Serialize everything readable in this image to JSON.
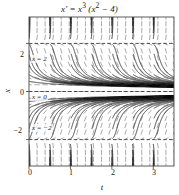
{
  "figure": {
    "title": "x' = x",
    "title_exp1": "3",
    "title_tail": " (x",
    "title_exp2": "2",
    "title_end": " − 4)",
    "title_plain": "x' = x3 (x2 - 4)",
    "xlabel": "t",
    "ylabel": "x"
  },
  "annotations": {
    "eq_top": "x = 2",
    "eq_mid": "x = 0",
    "eq_bot": "x = −2"
  },
  "axis": {
    "xticks": [
      "0",
      "1",
      "2",
      "3"
    ],
    "yticks": [
      "2",
      "0",
      "−2"
    ]
  },
  "colors": {
    "field": "#8a8a8a",
    "curve": "#2b2b2b",
    "equilibrium": "#3a3a3a",
    "frame": "#4a4a4a",
    "background": "#ffffff"
  },
  "chart_data": {
    "type": "line",
    "subtitle": "direction field with solution curves",
    "xlabel": "t",
    "ylabel": "x",
    "xlim": [
      0,
      3.5
    ],
    "ylim": [
      -3.1,
      3.1
    ],
    "xticks": [
      0,
      1,
      2,
      3
    ],
    "yticks": [
      2,
      0,
      -2
    ],
    "grid": false,
    "legend": null,
    "equilibria": [
      {
        "value": 2,
        "label": "x = 2",
        "style": "dashed",
        "stability": "unstable"
      },
      {
        "value": 0,
        "label": "x = 0",
        "style": "dashed",
        "stability": "stable"
      },
      {
        "value": -2,
        "label": "x = −2",
        "style": "dashed",
        "stability": "unstable"
      }
    ],
    "field": {
      "kind": "slope-field",
      "equation": "dx/dt = x^3 (x^2 - 4)",
      "description": "Short tick marks sampled on a grid; slope = x^3(x^2-4). Near-vertical upward for x>2, near-vertical downward for x<-2, gentle negative slopes for 0<x<2, gentle positive slopes for -2<x<0, flat along x=0, x=2, x=-2.",
      "nx": 18,
      "ny": 22
    },
    "series": [
      {
        "name": "solution x0=2.6",
        "x": [
          0,
          0.1,
          0.2,
          0.3
        ],
        "values": [
          2.6,
          2.9,
          3.6,
          5.2
        ],
        "note": "blows up upward"
      },
      {
        "name": "solution x0=1.9",
        "x": [
          0,
          0.5,
          1.0,
          1.5,
          2.0,
          2.5,
          3.0,
          3.5
        ],
        "values": [
          1.9,
          1.2,
          0.72,
          0.46,
          0.33,
          0.26,
          0.21,
          0.18
        ],
        "note": "decays toward 0"
      },
      {
        "name": "solution x0=1.0",
        "x": [
          0,
          0.5,
          1.0,
          1.5,
          2.0,
          2.5,
          3.0,
          3.5
        ],
        "values": [
          1.0,
          0.58,
          0.41,
          0.33,
          0.28,
          0.24,
          0.21,
          0.19
        ],
        "note": "decays toward 0"
      },
      {
        "name": "solution x0=0.45",
        "x": [
          0,
          0.5,
          1.0,
          1.5,
          2.0,
          2.5,
          3.0,
          3.5
        ],
        "values": [
          0.45,
          0.35,
          0.3,
          0.27,
          0.24,
          0.22,
          0.2,
          0.19
        ],
        "note": "decays toward 0"
      },
      {
        "name": "solution x0=-0.45",
        "x": [
          0,
          0.5,
          1.0,
          1.5,
          2.0,
          2.5,
          3.0,
          3.5
        ],
        "values": [
          -0.45,
          -0.35,
          -0.3,
          -0.27,
          -0.24,
          -0.22,
          -0.2,
          -0.19
        ],
        "note": "rises toward 0"
      },
      {
        "name": "solution x0=-1.0",
        "x": [
          0,
          0.5,
          1.0,
          1.5,
          2.0,
          2.5,
          3.0,
          3.5
        ],
        "values": [
          -1.0,
          -0.58,
          -0.41,
          -0.33,
          -0.28,
          -0.24,
          -0.21,
          -0.19
        ],
        "note": "rises toward 0"
      },
      {
        "name": "solution x0=-1.9",
        "x": [
          0,
          0.5,
          1.0,
          1.5,
          2.0,
          2.5,
          3.0,
          3.5
        ],
        "values": [
          -1.9,
          -1.2,
          -0.72,
          -0.46,
          -0.33,
          -0.26,
          -0.21,
          -0.18
        ],
        "note": "rises toward 0"
      },
      {
        "name": "solution x0=-2.6",
        "x": [
          0,
          0.1,
          0.2,
          0.3
        ],
        "values": [
          -2.6,
          -2.9,
          -3.6,
          -5.2
        ],
        "note": "blows up downward"
      }
    ]
  }
}
